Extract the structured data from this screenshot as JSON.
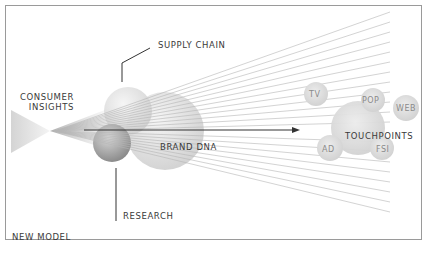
{
  "diagram": {
    "title": "NEW MODEL",
    "nodes": {
      "consumer_insights": {
        "line1": "CONSUMER",
        "line2": "INSIGHTS"
      },
      "supply_chain": "SUPPLY CHAIN",
      "brand_dna": "BRAND DNA",
      "research": "RESEARCH",
      "touchpoints": "TOUCHPOINTS"
    },
    "touchpoint_bubbles": [
      "TV",
      "POP",
      "WEB",
      "AD",
      "FSI"
    ],
    "colors": {
      "border": "#9a9a9a",
      "text": "#3a3a3a",
      "bubble_text": "#8a8a8a",
      "rays": "#b5b5b5",
      "arrow": "#333333"
    }
  }
}
